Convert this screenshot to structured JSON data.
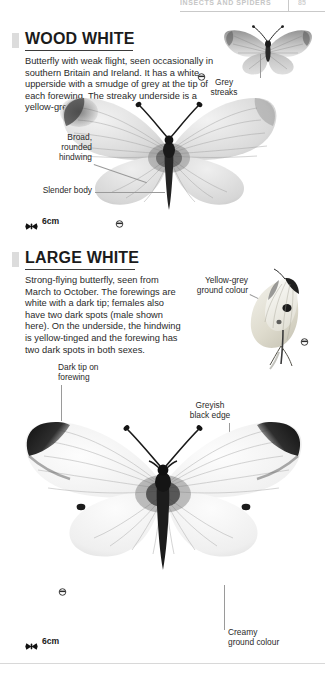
{
  "page": {
    "running_head": "INSECTS AND SPIDERS",
    "page_number": "85",
    "background_color": "#ffffff",
    "text_color": "#2a2a2a",
    "accent_tab_color": "#dcdcdc",
    "leader_line_color": "#9a9a9a"
  },
  "sections": [
    {
      "id": "wood-white",
      "title": "WOOD WHITE",
      "description": "Butterfly with weak flight, seen occasionally in southern Britain and Ireland. It has a white upperside with a smudge of grey at the tip of each forewing. The streaky underside is a yellow-grey.",
      "scale": {
        "value": "6cm",
        "icon": "butterfly-scale-icon"
      },
      "labels": [
        {
          "id": "grey-streaks",
          "text": "Grey\nstreaks"
        },
        {
          "id": "broad-rounded-hindwing",
          "text": "Broad,\nrounded\nhindwing"
        },
        {
          "id": "slender-body",
          "text": "Slender body"
        }
      ],
      "specimens": [
        {
          "id": "wood-white-underside",
          "view": "underside",
          "sex_symbol": "male"
        },
        {
          "id": "wood-white-upperside",
          "view": "upperside",
          "sex_symbol": "male"
        }
      ]
    },
    {
      "id": "large-white",
      "title": "LARGE WHITE",
      "description": "Strong-flying butterfly, seen from March to October. The forewings are white with a dark tip; females also have two dark spots (male shown here). On the underside, the hindwing is yellow-tinged and the forewing has two dark spots in both sexes.",
      "scale": {
        "value": "6cm",
        "icon": "butterfly-scale-icon"
      },
      "labels": [
        {
          "id": "yellow-grey-ground-colour",
          "text": "Yellow-grey\nground colour"
        },
        {
          "id": "dark-tip-on-forewing",
          "text": "Dark tip on\nforewing"
        },
        {
          "id": "greyish-black-edge",
          "text": "Greyish\nblack edge"
        },
        {
          "id": "creamy-ground-colour",
          "text": "Creamy\nground colour"
        }
      ],
      "specimens": [
        {
          "id": "large-white-underside",
          "view": "underside",
          "sex_symbol": "male"
        },
        {
          "id": "large-white-upperside",
          "view": "upperside",
          "sex_symbol": "male"
        }
      ]
    }
  ]
}
